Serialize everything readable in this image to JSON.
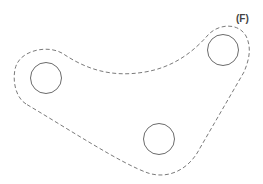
{
  "diagram": {
    "label": "(F)",
    "label_position": {
      "x": 236,
      "y": 14
    },
    "colors": {
      "circle_stroke": "#6b6b6b",
      "outline_stroke": "#7a7a7a",
      "label": "#444444",
      "background": "#ffffff"
    },
    "circles": [
      {
        "name": "left-hole",
        "cx": 46,
        "cy": 78,
        "r": 15.5
      },
      {
        "name": "bottom-hole",
        "cx": 159,
        "cy": 139,
        "r": 15.5
      },
      {
        "name": "right-hole",
        "cx": 223,
        "cy": 50,
        "r": 15.5
      }
    ],
    "outline": {
      "style": "dashed",
      "description": "Dashed boundary enclosing three circles with a concave top edge"
    }
  }
}
